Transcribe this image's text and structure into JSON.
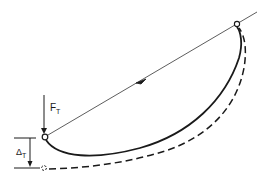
{
  "diagram": {
    "colors": {
      "ink": "#1a1a1a",
      "background": "#ffffff"
    },
    "labels": {
      "force": {
        "main": "F",
        "sub": "T"
      },
      "deflection": {
        "main": "Δ",
        "sub": "T"
      }
    },
    "elements": {
      "chord_line": "straight line from left node to upper-right, with direction arrow at midpoint",
      "solid_curve": "original sagging curve between left node and right node",
      "dashed_curve": "deflected curve from right node to displaced left node",
      "nodes": [
        "left-node",
        "right-node",
        "displaced-node"
      ]
    }
  }
}
